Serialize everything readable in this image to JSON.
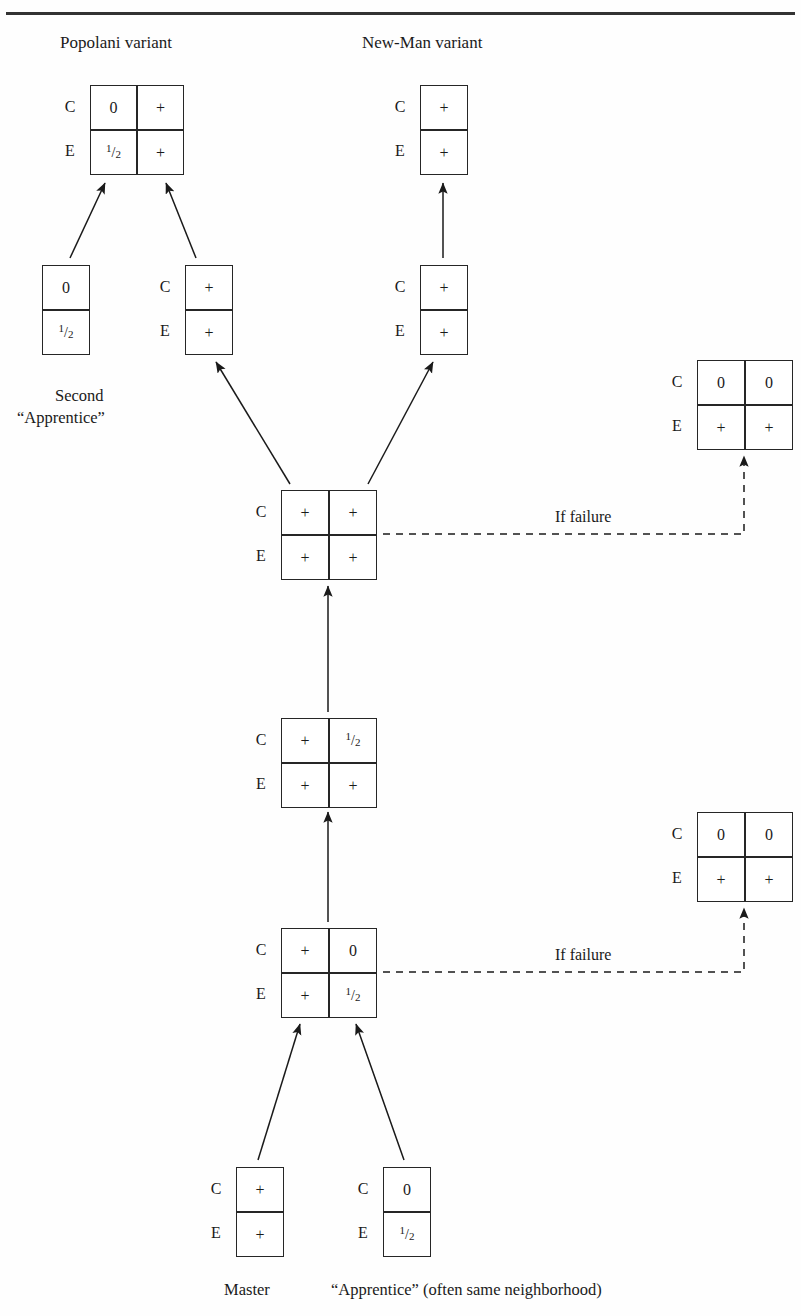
{
  "page": {
    "width": 801,
    "height": 1316,
    "background": "#fefefe",
    "ink": "#1a1a1a",
    "rule_color": "#333333"
  },
  "headings": {
    "popolani": "Popolani variant",
    "newman": "New-Man variant"
  },
  "captions": {
    "second_line1": "Second",
    "second_line2": "“Apprentice”",
    "master": "Master",
    "apprentice": "“Apprentice” (often same neighborhood)"
  },
  "edge_labels": {
    "if_failure_top": "If failure",
    "if_failure_bottom": "If failure"
  },
  "row_labels": {
    "c": "C",
    "e": "E"
  },
  "symbols": {
    "plus": "+",
    "zero": "0",
    "half_numerator": "1",
    "half_slash": "/",
    "half_denominator": "2"
  },
  "matrices": [
    {
      "id": "popolani-result",
      "name": "popolani-variant-matrix",
      "cols": 2,
      "rows": 2,
      "x": 90,
      "y": 85,
      "w": 92,
      "h": 88,
      "row_labels": [
        "C",
        "E"
      ],
      "cells": [
        [
          "0",
          "+"
        ],
        [
          "1/2",
          "+"
        ]
      ]
    },
    {
      "id": "newman-result",
      "name": "new-man-variant-matrix",
      "cols": 1,
      "rows": 2,
      "x": 420,
      "y": 85,
      "w": 46,
      "h": 88,
      "row_labels": [
        "C",
        "E"
      ],
      "cells": [
        [
          "+"
        ],
        [
          "+"
        ]
      ]
    },
    {
      "id": "second-apprentice",
      "name": "second-apprentice-matrix",
      "cols": 1,
      "rows": 2,
      "x": 42,
      "y": 265,
      "w": 46,
      "h": 88,
      "row_labels": [
        "",
        ""
      ],
      "cells": [
        [
          "0"
        ],
        [
          "1/2"
        ]
      ]
    },
    {
      "id": "popolani-parent",
      "name": "popolani-parent-matrix",
      "cols": 1,
      "rows": 2,
      "x": 185,
      "y": 265,
      "w": 46,
      "h": 88,
      "row_labels": [
        "C",
        "E"
      ],
      "cells": [
        [
          "+"
        ],
        [
          "+"
        ]
      ]
    },
    {
      "id": "newman-parent",
      "name": "new-man-parent-matrix",
      "cols": 1,
      "rows": 2,
      "x": 420,
      "y": 265,
      "w": 46,
      "h": 88,
      "row_labels": [
        "C",
        "E"
      ],
      "cells": [
        [
          "+"
        ],
        [
          "+"
        ]
      ]
    },
    {
      "id": "center-full",
      "name": "center-full-plus-matrix",
      "cols": 2,
      "rows": 2,
      "x": 281,
      "y": 490,
      "w": 94,
      "h": 88,
      "row_labels": [
        "C",
        "E"
      ],
      "cells": [
        [
          "+",
          "+"
        ],
        [
          "+",
          "+"
        ]
      ]
    },
    {
      "id": "failure-top",
      "name": "failure-outcome-top-matrix",
      "cols": 2,
      "rows": 2,
      "x": 697,
      "y": 360,
      "w": 94,
      "h": 88,
      "row_labels": [
        "C",
        "E"
      ],
      "cells": [
        [
          "0",
          "0"
        ],
        [
          "+",
          "+"
        ]
      ]
    },
    {
      "id": "mid-half",
      "name": "mid-stage-matrix",
      "cols": 2,
      "rows": 2,
      "x": 281,
      "y": 718,
      "w": 94,
      "h": 88,
      "row_labels": [
        "C",
        "E"
      ],
      "cells": [
        [
          "+",
          "1/2"
        ],
        [
          "+",
          "+"
        ]
      ]
    },
    {
      "id": "failure-bottom",
      "name": "failure-outcome-bottom-matrix",
      "cols": 2,
      "rows": 2,
      "x": 697,
      "y": 812,
      "w": 94,
      "h": 88,
      "row_labels": [
        "C",
        "E"
      ],
      "cells": [
        [
          "0",
          "0"
        ],
        [
          "+",
          "+"
        ]
      ]
    },
    {
      "id": "lower-zero",
      "name": "lower-stage-matrix",
      "cols": 2,
      "rows": 2,
      "x": 281,
      "y": 928,
      "w": 94,
      "h": 88,
      "row_labels": [
        "C",
        "E"
      ],
      "cells": [
        [
          "+",
          "0"
        ],
        [
          "+",
          "1/2"
        ]
      ]
    },
    {
      "id": "master",
      "name": "master-matrix",
      "cols": 1,
      "rows": 2,
      "x": 236,
      "y": 1167,
      "w": 46,
      "h": 88,
      "row_labels": [
        "C",
        "E"
      ],
      "cells": [
        [
          "+"
        ],
        [
          "+"
        ]
      ]
    },
    {
      "id": "apprentice",
      "name": "apprentice-matrix",
      "cols": 1,
      "rows": 2,
      "x": 383,
      "y": 1167,
      "w": 46,
      "h": 88,
      "row_labels": [
        "C",
        "E"
      ],
      "cells": [
        [
          "0"
        ],
        [
          "1/2"
        ]
      ]
    }
  ],
  "arrows": {
    "solid": [
      {
        "name": "arrow-second-apprentice-to-popolani",
        "x1": 70,
        "y1": 258,
        "x2": 105,
        "y2": 183
      },
      {
        "name": "arrow-popolani-parent-to-popolani",
        "x1": 196,
        "y1": 258,
        "x2": 166,
        "y2": 183
      },
      {
        "name": "arrow-newman-parent-to-newman",
        "x1": 443,
        "y1": 258,
        "x2": 443,
        "y2": 183
      },
      {
        "name": "arrow-center-to-popolani-parent",
        "x1": 290,
        "y1": 484,
        "x2": 216,
        "y2": 362
      },
      {
        "name": "arrow-center-to-newman-parent",
        "x1": 368,
        "y1": 484,
        "x2": 433,
        "y2": 362
      },
      {
        "name": "arrow-mid-to-center",
        "x1": 328,
        "y1": 712,
        "x2": 328,
        "y2": 586
      },
      {
        "name": "arrow-lower-to-mid",
        "x1": 328,
        "y1": 922,
        "x2": 328,
        "y2": 812
      },
      {
        "name": "arrow-master-to-lower",
        "x1": 258,
        "y1": 1160,
        "x2": 300,
        "y2": 1024
      },
      {
        "name": "arrow-apprentice-to-lower",
        "x1": 404,
        "y1": 1160,
        "x2": 356,
        "y2": 1024
      }
    ],
    "dashed": [
      {
        "name": "dashed-failure-top",
        "points": [
          [
            383,
            534
          ],
          [
            744,
            534
          ],
          [
            744,
            456
          ]
        ]
      },
      {
        "name": "dashed-failure-bottom",
        "points": [
          [
            383,
            972
          ],
          [
            744,
            972
          ],
          [
            744,
            908
          ]
        ]
      }
    ]
  }
}
